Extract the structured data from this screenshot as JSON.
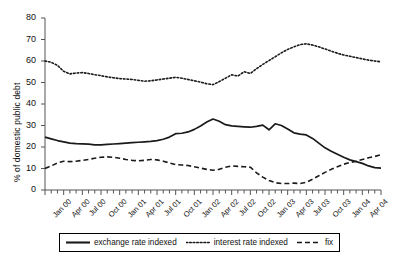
{
  "chart_data": {
    "type": "line",
    "title": "",
    "xlabel": "",
    "ylabel": "% of domestic public debt",
    "ylim": [
      0,
      80
    ],
    "ytick_values": [
      0,
      10,
      20,
      30,
      40,
      50,
      60,
      70,
      80
    ],
    "grid": false,
    "legend_position": "bottom",
    "x_tick_labels": [
      "Jan 00",
      "Apr 00",
      "Jul 00",
      "Oct 00",
      "Jan 01",
      "Apr 01",
      "Jul 01",
      "Oct 01",
      "Jan 02",
      "Apr 02",
      "Jul 02",
      "Oct 02",
      "Jan 03",
      "Apr 03",
      "Jul 03",
      "Oct 03",
      "Jan 04",
      "Apr 04"
    ],
    "x": [
      "Jan 00",
      "Feb 00",
      "Mar 00",
      "Apr 00",
      "May 00",
      "Jun 00",
      "Jul 00",
      "Aug 00",
      "Sep 00",
      "Oct 00",
      "Nov 00",
      "Dec 00",
      "Jan 01",
      "Feb 01",
      "Mar 01",
      "Apr 01",
      "May 01",
      "Jun 01",
      "Jul 01",
      "Aug 01",
      "Sep 01",
      "Oct 01",
      "Nov 01",
      "Dec 01",
      "Jan 02",
      "Feb 02",
      "Mar 02",
      "Apr 02",
      "May 02",
      "Jun 02",
      "Jul 02",
      "Aug 02",
      "Sep 02",
      "Oct 02",
      "Nov 02",
      "Dec 02",
      "Jan 03",
      "Feb 03",
      "Mar 03",
      "Apr 03",
      "May 03",
      "Jun 03",
      "Jul 03",
      "Aug 03",
      "Sep 03",
      "Oct 03",
      "Nov 03",
      "Dec 03",
      "Jan 04",
      "Feb 04",
      "Mar 04",
      "Apr 04",
      "May 04",
      "Jun 04",
      "Jul 04"
    ],
    "series": [
      {
        "name": "exchange rate indexed",
        "style": "solid",
        "color": "#1a1a1a",
        "values": [
          24.6,
          23.8,
          23.0,
          22.4,
          21.8,
          21.6,
          21.5,
          21.3,
          21.0,
          21.0,
          21.2,
          21.4,
          21.6,
          21.8,
          22.0,
          22.2,
          22.4,
          22.6,
          23.0,
          23.6,
          24.6,
          26.2,
          26.4,
          27.0,
          28.2,
          29.8,
          31.6,
          33.0,
          32.0,
          30.4,
          29.8,
          29.6,
          29.4,
          29.2,
          29.6,
          30.2,
          28.0,
          30.8,
          30.0,
          28.4,
          26.6,
          26.0,
          25.6,
          24.0,
          21.8,
          19.6,
          18.0,
          16.6,
          15.2,
          14.0,
          13.2,
          12.4,
          11.2,
          10.4,
          10.2
        ]
      },
      {
        "name": "interest rate indexed",
        "style": "dotted",
        "color": "#1a1a1a",
        "values": [
          60.0,
          59.4,
          58.0,
          55.2,
          54.0,
          54.4,
          54.6,
          54.2,
          53.6,
          53.2,
          52.6,
          52.2,
          51.8,
          51.6,
          51.4,
          51.0,
          50.6,
          50.8,
          51.2,
          51.6,
          52.0,
          52.4,
          52.0,
          51.4,
          50.8,
          50.2,
          49.4,
          49.0,
          50.4,
          52.0,
          53.6,
          53.0,
          55.0,
          54.2,
          56.4,
          58.4,
          60.2,
          62.0,
          63.8,
          65.4,
          66.6,
          67.6,
          68.0,
          67.4,
          66.6,
          65.6,
          64.6,
          63.6,
          62.8,
          62.2,
          61.6,
          61.0,
          60.4,
          60.0,
          59.6
        ]
      },
      {
        "name": "fix",
        "style": "dashed",
        "color": "#1a1a1a",
        "values": [
          10.0,
          11.2,
          12.6,
          13.4,
          13.2,
          13.4,
          13.8,
          14.2,
          14.8,
          15.2,
          15.4,
          15.2,
          14.8,
          14.2,
          13.8,
          13.6,
          13.8,
          14.2,
          14.0,
          13.4,
          12.6,
          11.8,
          11.6,
          11.4,
          10.8,
          10.2,
          9.6,
          9.2,
          9.6,
          10.6,
          11.2,
          11.0,
          10.8,
          10.6,
          8.0,
          6.0,
          4.4,
          3.4,
          3.0,
          3.0,
          3.2,
          3.0,
          3.6,
          5.0,
          6.6,
          8.2,
          9.6,
          10.8,
          12.0,
          12.8,
          13.4,
          14.2,
          15.0,
          15.6,
          16.4
        ]
      }
    ]
  },
  "legend": {
    "items": [
      {
        "label": "exchange rate indexed",
        "style": "solid"
      },
      {
        "label": "interest rate indexed",
        "style": "dotted"
      },
      {
        "label": "fix",
        "style": "dashed"
      }
    ]
  }
}
